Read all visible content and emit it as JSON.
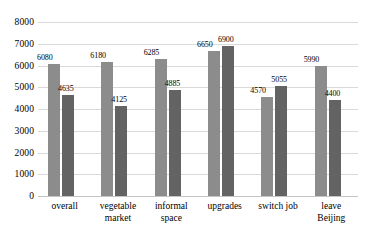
{
  "chart_data": {
    "type": "bar",
    "title": "",
    "subtitle": "",
    "xlabel": "",
    "ylabel": "",
    "ylim": [
      0,
      8000
    ],
    "ytick_step": 1000,
    "yticks": [
      0,
      1000,
      2000,
      3000,
      4000,
      5000,
      6000,
      7000,
      8000
    ],
    "ytick_labels": [
      "0",
      "1000",
      "2000",
      "3000",
      "4000",
      "5000",
      "6000",
      "7000",
      "8000"
    ],
    "grid": true,
    "grid_axis": "y",
    "legend": false,
    "legend_position": "none",
    "categories": [
      "overall",
      "vegetable\nmarket",
      "informal\nspace",
      "upgrades",
      "switch job",
      "leave\nBeijing"
    ],
    "series": [
      {
        "name": "series-1",
        "color": "#8c8c8c",
        "values": [
          6080,
          6180,
          6285,
          6650,
          4570,
          5990
        ],
        "labels": [
          "6080",
          "6180",
          "6285",
          "6650",
          "4570",
          "5990"
        ]
      },
      {
        "name": "series-2",
        "color": "#636363",
        "values": [
          4635,
          4125,
          4885,
          6900,
          5055,
          4400
        ],
        "labels": [
          "4635",
          "4125",
          "4885",
          "6900",
          "5055",
          "4400"
        ]
      }
    ]
  },
  "style": {
    "background": "#ffffff",
    "gridline_color": "#d9d9d9",
    "baseline_color": "#c4c4c4",
    "text_color": "#000000"
  }
}
